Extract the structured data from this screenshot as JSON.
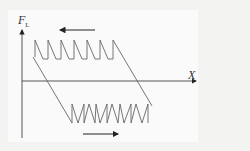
{
  "diagram": {
    "type": "force-displacement hysteresis (stick-slip sawtooth)",
    "y_axis_label": "F",
    "y_axis_subscript": "L",
    "x_axis_label": "X",
    "top_arrow_direction": "left",
    "bottom_arrow_direction": "right",
    "top_sawtooth_teeth": 7,
    "bottom_sawtooth_teeth": 7,
    "colors": {
      "background": "#f3f3f2",
      "panel": "#fafafa",
      "line": "#666666",
      "axis": "#444444",
      "arrow": "#222222"
    }
  }
}
